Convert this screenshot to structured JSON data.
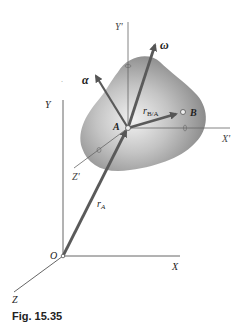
{
  "figure": {
    "caption": "Fig. 15.35",
    "labels": {
      "Y_prime": "Y'",
      "X_prime": "X'",
      "Z_prime": "Z'",
      "Y": "Y",
      "X": "X",
      "Z": "Z",
      "O": "O",
      "A": "A",
      "B": "B",
      "omega": "ω",
      "alpha": "α",
      "r_BA_main": "r",
      "r_BA_sub": "B/A",
      "r_A_main": "r",
      "r_A_sub": "A"
    },
    "colors": {
      "body_fill_center": "#e8e8e8",
      "body_fill_edge": "#8a8a8a",
      "vector": "#5a5a5a",
      "axis": "#666666"
    }
  }
}
